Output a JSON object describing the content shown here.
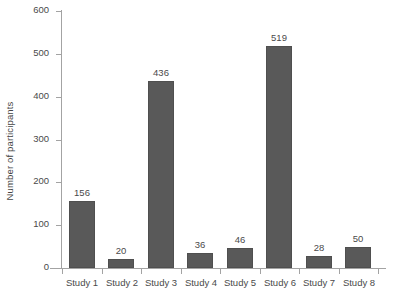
{
  "chart_data": {
    "type": "bar",
    "title": "",
    "subtitle": "",
    "xlabel": "",
    "ylabel": "Number of participants",
    "categories": [
      "Study 1",
      "Study 2",
      "Study 3",
      "Study 4",
      "Study 5",
      "Study 6",
      "Study 7",
      "Study 8"
    ],
    "values": [
      156,
      20,
      436,
      36,
      46,
      519,
      28,
      50
    ],
    "data_labels": [
      "156",
      "20",
      "436",
      "36",
      "46",
      "519",
      "28",
      "50"
    ],
    "ylim": [
      0,
      600
    ],
    "ytick_labels": [
      "0",
      "100",
      "200",
      "300",
      "400",
      "500",
      "600"
    ],
    "ytick_values": [
      0,
      100,
      200,
      300,
      400,
      500,
      600
    ],
    "grid": false,
    "legend": null,
    "legend_position": "none",
    "bar_color": "#595959",
    "bar_edge_color": "#4f4f4f",
    "axis_color": "#a3a3a3",
    "text_color": "#4a4a4a",
    "background_color": "#ffffff",
    "annotations": []
  }
}
